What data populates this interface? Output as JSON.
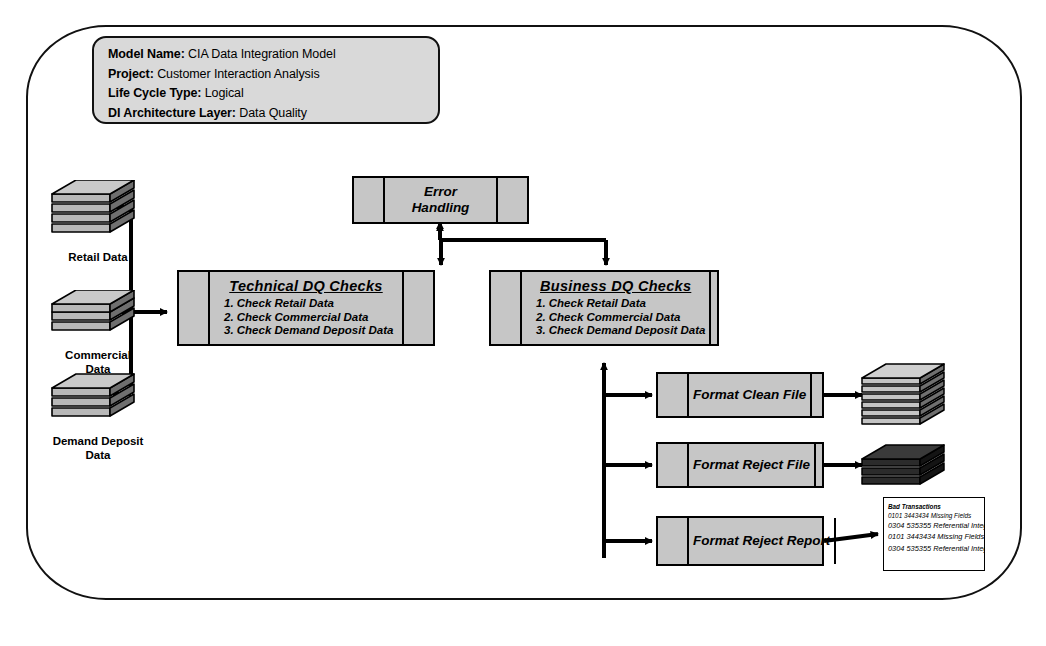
{
  "header": {
    "rows": [
      {
        "label": "Model Name:",
        "value": "CIA Data Integration Model"
      },
      {
        "label": "Project:",
        "value": "Customer Interaction Analysis"
      },
      {
        "label": "Life Cycle Type:",
        "value": "Logical"
      },
      {
        "label": "DI Architecture Layer:",
        "value": "Data Quality"
      }
    ]
  },
  "sources": [
    {
      "label_line1": "Retail Data",
      "label_line2": ""
    },
    {
      "label_line1": "Commercial",
      "label_line2": "Data"
    },
    {
      "label_line1": "Demand Deposit",
      "label_line2": "Data"
    }
  ],
  "processes": {
    "error_handling": {
      "line1": "Error",
      "line2": "Handling"
    },
    "technical_dq": {
      "title": "Technical  DQ Checks",
      "items": [
        "1. Check Retail Data",
        "2. Check Commercial Data",
        "3. Check Demand Deposit Data"
      ]
    },
    "business_dq": {
      "title": "Business  DQ Checks",
      "items": [
        "1. Check Retail Data",
        "2. Check Commercial Data",
        "3. Check Demand Deposit Data"
      ]
    },
    "format_clean_file": {
      "label": "Format Clean File"
    },
    "format_reject_file": {
      "label": "Format Reject File"
    },
    "format_reject_report": {
      "label": "Format Reject Report"
    }
  },
  "outputs": {
    "clean_file_stack": {
      "name": "clean-file-stack"
    },
    "reject_file_stack": {
      "name": "reject-file-stack"
    },
    "report": {
      "title": "Bad Transactions",
      "lines": [
        "0101 3443434 Missing Fields",
        "0304 535355 Referential Integrity",
        "0101 3443434 Missing Fields",
        "0304 535355 Referential Integrity"
      ]
    }
  },
  "colors": {
    "box_fill": "#c6c6c6",
    "meta_fill": "#d9d9d9",
    "stroke": "#000000",
    "stack_light": "#b8b8b8",
    "stack_dark": "#2b2b2b",
    "page_bg": "#ffffff"
  }
}
